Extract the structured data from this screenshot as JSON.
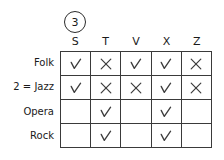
{
  "marker": {
    "label": "3"
  },
  "table": {
    "columns": [
      "S",
      "T",
      "V",
      "X",
      "Z"
    ],
    "rows": [
      {
        "label": "Folk",
        "cells": [
          "check",
          "cross",
          "check",
          "check",
          "cross"
        ]
      },
      {
        "label": "2 = Jazz",
        "cells": [
          "check",
          "cross",
          "cross",
          "check",
          "cross"
        ]
      },
      {
        "label": "Opera",
        "cells": [
          "",
          "check",
          "",
          "check",
          ""
        ]
      },
      {
        "label": "Rock",
        "cells": [
          "",
          "check",
          "",
          "check",
          ""
        ]
      }
    ]
  },
  "colors": {
    "ink": "#1a1a1a",
    "rule": "#3a3a3a",
    "mark": "#3c3c3c",
    "background": "#ffffff"
  }
}
